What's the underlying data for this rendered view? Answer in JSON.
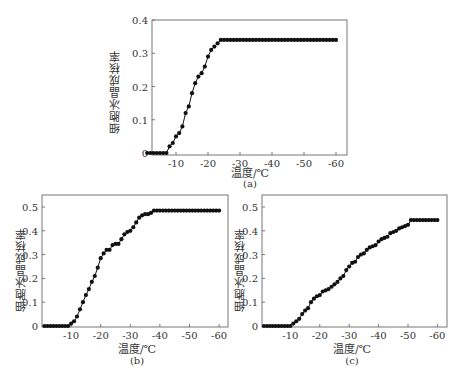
{
  "figure": {
    "ylabel": "细胞冰晶成核率",
    "xlabel": "温度/℃",
    "panels": [
      "(a)",
      "(b)",
      "(c)"
    ]
  },
  "chart_data": [
    {
      "type": "line",
      "title": "(a)",
      "xlabel": "温度/℃",
      "ylabel": "细胞冰晶成核率",
      "xlim": [
        0,
        -60
      ],
      "ylim": [
        0,
        0.4
      ],
      "xticks": [
        -10,
        -20,
        -30,
        -40,
        -50,
        -60
      ],
      "yticks": [
        0,
        0.1,
        0.2,
        0.3,
        0.4
      ],
      "ytick_labels": [
        "0",
        "0.1",
        "0.2",
        "0.3",
        "0.4"
      ],
      "grid": false,
      "marker": "circle",
      "x": [
        -1,
        -2,
        -3,
        -4,
        -5,
        -6,
        -7,
        -8,
        -9,
        -10,
        -11,
        -12,
        -13,
        -14,
        -15,
        -16,
        -17,
        -18,
        -19,
        -20,
        -21,
        -22,
        -23,
        -24,
        -25,
        -26,
        -27,
        -28,
        -29,
        -30,
        -31,
        -32,
        -33,
        -34,
        -35,
        -36,
        -37,
        -38,
        -39,
        -40,
        -41,
        -42,
        -43,
        -44,
        -45,
        -46,
        -47,
        -48,
        -49,
        -50,
        -51,
        -52,
        -53,
        -54,
        -55,
        -56,
        -57,
        -58,
        -59,
        -60
      ],
      "values": [
        0,
        0,
        0,
        0,
        0,
        0,
        0,
        0.02,
        0.03,
        0.05,
        0.06,
        0.08,
        0.12,
        0.14,
        0.18,
        0.21,
        0.23,
        0.24,
        0.26,
        0.29,
        0.31,
        0.32,
        0.33,
        0.34,
        0.34,
        0.34,
        0.34,
        0.34,
        0.34,
        0.34,
        0.34,
        0.34,
        0.34,
        0.34,
        0.34,
        0.34,
        0.34,
        0.34,
        0.34,
        0.34,
        0.34,
        0.34,
        0.34,
        0.34,
        0.34,
        0.34,
        0.34,
        0.34,
        0.34,
        0.34,
        0.34,
        0.34,
        0.34,
        0.34,
        0.34,
        0.34,
        0.34,
        0.34,
        0.34,
        0.34
      ]
    },
    {
      "type": "line",
      "title": "(b)",
      "xlabel": "温度/℃",
      "ylabel": "细胞冰晶成核率",
      "xlim": [
        0,
        -60
      ],
      "ylim": [
        0,
        0.5
      ],
      "xticks": [
        -10,
        -20,
        -30,
        -40,
        -50,
        -60
      ],
      "yticks": [
        0,
        0.1,
        0.2,
        0.3,
        0.4,
        0.5
      ],
      "ytick_labels": [
        "0",
        "0.1",
        "0.2",
        "0.3",
        "0.4",
        "0.5"
      ],
      "grid": false,
      "marker": "circle",
      "x": [
        -1,
        -2,
        -3,
        -4,
        -5,
        -6,
        -7,
        -8,
        -9,
        -10,
        -11,
        -12,
        -13,
        -14,
        -15,
        -16,
        -17,
        -18,
        -19,
        -20,
        -21,
        -22,
        -23,
        -24,
        -25,
        -26,
        -27,
        -28,
        -29,
        -30,
        -31,
        -32,
        -33,
        -34,
        -35,
        -36,
        -37,
        -38,
        -39,
        -40,
        -41,
        -42,
        -43,
        -44,
        -45,
        -46,
        -47,
        -48,
        -49,
        -50,
        -51,
        -52,
        -53,
        -54,
        -55,
        -56,
        -57,
        -58,
        -59,
        -60
      ],
      "values": [
        0,
        0,
        0,
        0,
        0,
        0,
        0,
        0,
        0,
        0.01,
        0.02,
        0.04,
        0.07,
        0.1,
        0.13,
        0.155,
        0.185,
        0.21,
        0.245,
        0.285,
        0.305,
        0.32,
        0.32,
        0.34,
        0.345,
        0.345,
        0.365,
        0.385,
        0.395,
        0.4,
        0.415,
        0.435,
        0.455,
        0.465,
        0.47,
        0.47,
        0.475,
        0.485,
        0.485,
        0.485,
        0.485,
        0.485,
        0.485,
        0.485,
        0.485,
        0.485,
        0.485,
        0.485,
        0.485,
        0.485,
        0.485,
        0.485,
        0.485,
        0.485,
        0.485,
        0.485,
        0.485,
        0.485,
        0.485,
        0.485
      ]
    },
    {
      "type": "line",
      "title": "(c)",
      "xlabel": "温度/℃",
      "ylabel": "细胞冰晶成核率",
      "xlim": [
        0,
        -60
      ],
      "ylim": [
        0,
        0.5
      ],
      "xticks": [
        -10,
        -20,
        -30,
        -40,
        -50,
        -60
      ],
      "yticks": [
        0,
        0.1,
        0.2,
        0.3,
        0.4,
        0.5
      ],
      "ytick_labels": [
        "0",
        "0.1",
        "0.2",
        "0.3",
        "0.4",
        "0.5"
      ],
      "grid": false,
      "marker": "circle",
      "x": [
        -1,
        -2,
        -3,
        -4,
        -5,
        -6,
        -7,
        -8,
        -9,
        -10,
        -11,
        -12,
        -13,
        -14,
        -15,
        -16,
        -17,
        -18,
        -19,
        -20,
        -21,
        -22,
        -23,
        -24,
        -25,
        -26,
        -27,
        -28,
        -29,
        -30,
        -31,
        -32,
        -33,
        -34,
        -35,
        -36,
        -37,
        -38,
        -39,
        -40,
        -41,
        -42,
        -43,
        -44,
        -45,
        -46,
        -47,
        -48,
        -49,
        -50,
        -51,
        -52,
        -53,
        -54,
        -55,
        -56,
        -57,
        -58,
        -59,
        -60
      ],
      "values": [
        0,
        0,
        0,
        0,
        0,
        0,
        0,
        0,
        0,
        0,
        0.01,
        0.02,
        0.03,
        0.05,
        0.065,
        0.075,
        0.1,
        0.115,
        0.125,
        0.13,
        0.145,
        0.15,
        0.155,
        0.165,
        0.175,
        0.185,
        0.2,
        0.21,
        0.235,
        0.25,
        0.265,
        0.27,
        0.29,
        0.3,
        0.305,
        0.32,
        0.33,
        0.335,
        0.34,
        0.355,
        0.365,
        0.37,
        0.375,
        0.39,
        0.395,
        0.4,
        0.41,
        0.415,
        0.42,
        0.425,
        0.445,
        0.445,
        0.445,
        0.445,
        0.445,
        0.445,
        0.445,
        0.445,
        0.445,
        0.445
      ]
    }
  ]
}
